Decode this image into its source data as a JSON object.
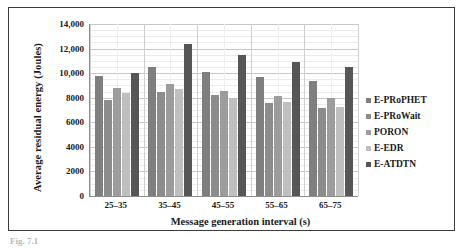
{
  "caption_fragment": "Fig. 7.1",
  "chart_data": {
    "type": "bar",
    "title": "",
    "subtitle": "",
    "xlabel": "Message generation interval (s)",
    "ylabel": "Average residual energy (Joules)",
    "categories": [
      "25–35",
      "35–45",
      "45–55",
      "55–65",
      "65–75"
    ],
    "ytick_labels": [
      "0",
      "2000",
      "4000",
      "6000",
      "8000",
      "10,000",
      "12,000",
      "14,000"
    ],
    "ytick_values": [
      0,
      2000,
      4000,
      6000,
      8000,
      10000,
      12000,
      14000
    ],
    "ylim": [
      0,
      14000
    ],
    "grid": true,
    "minor_grid": true,
    "legend_position": "right",
    "series": [
      {
        "name": "E-PRoPHET",
        "color": "#7f7f7f",
        "values": [
          9750,
          10500,
          10100,
          9650,
          9400
        ]
      },
      {
        "name": "E-PRoWait",
        "color": "#8c8c8c",
        "values": [
          7800,
          8500,
          8200,
          7600,
          7200
        ]
      },
      {
        "name": "PORON",
        "color": "#9c9c9c",
        "values": [
          8800,
          9150,
          8550,
          8150,
          7950
        ]
      },
      {
        "name": "E-EDR",
        "color": "#bfbfbf",
        "values": [
          8400,
          8700,
          8000,
          7650,
          7250
        ]
      },
      {
        "name": "E-ATDTN",
        "color": "#565656",
        "values": [
          10050,
          12400,
          11450,
          10900,
          10500
        ]
      }
    ]
  }
}
